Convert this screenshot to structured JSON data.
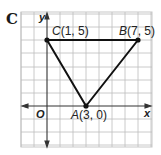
{
  "panel": {
    "label": "C"
  },
  "axes": {
    "x_label": "x",
    "y_label": "y",
    "origin_label": "O"
  },
  "colors": {
    "grid": "#b8b8b8",
    "axis": "#333333",
    "triangle": "#111111",
    "background": "#ffffff"
  },
  "points": [
    {
      "name": "C",
      "coords": "(1, 5)",
      "x": 1,
      "y": 5
    },
    {
      "name": "B",
      "coords": "(7, 5)",
      "x": 7,
      "y": 5
    },
    {
      "name": "A",
      "coords": "(3, 0)",
      "x": 3,
      "y": 0
    }
  ],
  "grid": {
    "x_min": -2,
    "x_max": 8,
    "y_min": -3,
    "y_max": 7
  }
}
